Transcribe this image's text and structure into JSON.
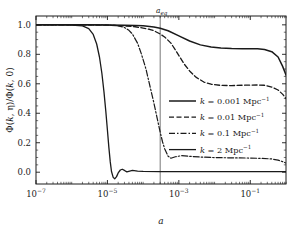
{
  "figure": {
    "background": "#ffffff",
    "line_color": "#1a1a1a",
    "axis_color": "#1a1a1a",
    "vline_color": "#555555"
  },
  "axes": {
    "xlabel": "a",
    "ylabel_parts": {
      "num": "Φ(k, η)",
      "den": "Φ(k, 0)",
      "full": "Φ(k, η)/Φ(k, 0)"
    },
    "x_scale": "log",
    "y_scale": "linear",
    "xlim": [
      1e-07,
      1.0
    ],
    "ylim": [
      -0.08,
      1.06
    ],
    "x_major_ticks": [
      {
        "value": 1e-07,
        "mantissa": "10",
        "exponent": "−7"
      },
      {
        "value": 1e-05,
        "mantissa": "10",
        "exponent": "−5"
      },
      {
        "value": 0.001,
        "mantissa": "10",
        "exponent": "−3"
      },
      {
        "value": 0.1,
        "mantissa": "10",
        "exponent": "−1"
      }
    ],
    "y_ticks": [
      {
        "value": 0.0,
        "label": "0.0"
      },
      {
        "value": 0.2,
        "label": "0.2"
      },
      {
        "value": 0.4,
        "label": "0.4"
      },
      {
        "value": 0.6,
        "label": "0.6"
      },
      {
        "value": 0.8,
        "label": "0.8"
      },
      {
        "value": 1.0,
        "label": "1.0"
      }
    ],
    "grid": false
  },
  "annotations": [
    {
      "name": "a-eq-vline",
      "base": "a",
      "subscript": "eq",
      "x_value": 0.0003,
      "style": "vertical-line"
    }
  ],
  "legend": {
    "position": "center-right",
    "entries": [
      {
        "label": "k = 0.001 Mpc⁻¹",
        "k_symbol": "k",
        "equals": "=",
        "value": "0.001",
        "unit": "Mpc",
        "unit_exp": "−1",
        "style": "solid",
        "width": 1.5
      },
      {
        "label": "k = 0.01 Mpc⁻¹",
        "k_symbol": "k",
        "equals": "=",
        "value": "0.01",
        "unit": "Mpc",
        "unit_exp": "−1",
        "style": "dashed",
        "width": 1.3
      },
      {
        "label": "k = 0.1 Mpc⁻¹",
        "k_symbol": "k",
        "equals": "=",
        "value": "0.1",
        "unit": "Mpc",
        "unit_exp": "−1",
        "style": "dashdot",
        "width": 1.2
      },
      {
        "label": "k = 2 Mpc⁻¹",
        "k_symbol": "k",
        "equals": "=",
        "value": "2",
        "unit": "Mpc",
        "unit_exp": "−1",
        "style": "solid",
        "width": 1.3
      }
    ]
  },
  "chart_data": {
    "type": "line",
    "title": "",
    "xlabel": "a",
    "ylabel": "Φ(k, η)/Φ(k, 0)",
    "xscale": "log",
    "xlim": [
      1e-07,
      1.0
    ],
    "ylim": [
      -0.08,
      1.06
    ],
    "grid": false,
    "legend_position": "center-right",
    "vertical_marker": {
      "label": "a_eq",
      "x": 0.0003
    },
    "series": [
      {
        "name": "k = 0.001 Mpc^-1",
        "style": "solid",
        "x": [
          1e-07,
          3e-07,
          1e-06,
          3e-06,
          1e-05,
          3e-05,
          6e-05,
          0.0001,
          0.0002,
          0.0003,
          0.0005,
          0.001,
          0.002,
          0.004,
          0.008,
          0.015,
          0.03,
          0.06,
          0.1,
          0.16,
          0.25,
          0.4,
          0.6,
          0.8,
          1.0
        ],
        "y": [
          1.0,
          1.0,
          1.0,
          1.0,
          0.999,
          0.998,
          0.996,
          0.993,
          0.985,
          0.977,
          0.96,
          0.925,
          0.89,
          0.864,
          0.85,
          0.843,
          0.839,
          0.838,
          0.838,
          0.837,
          0.833,
          0.818,
          0.782,
          0.72,
          0.66
        ]
      },
      {
        "name": "k = 0.01 Mpc^-1",
        "style": "dashed",
        "x": [
          1e-07,
          3e-07,
          1e-06,
          3e-06,
          1e-05,
          3e-05,
          6e-05,
          0.0001,
          0.00015,
          0.0002,
          0.0003,
          0.0004,
          0.0006,
          0.0009,
          0.0014,
          0.002,
          0.003,
          0.005,
          0.008,
          0.015,
          0.03,
          0.06,
          0.1,
          0.16,
          0.25,
          0.4,
          0.6,
          0.8,
          1.0
        ],
        "y": [
          1.0,
          1.0,
          1.0,
          0.999,
          0.998,
          0.993,
          0.987,
          0.978,
          0.97,
          0.96,
          0.938,
          0.918,
          0.876,
          0.81,
          0.735,
          0.687,
          0.645,
          0.612,
          0.597,
          0.589,
          0.588,
          0.59,
          0.591,
          0.592,
          0.59,
          0.578,
          0.558,
          0.53,
          0.5
        ]
      },
      {
        "name": "k = 0.1 Mpc^-1",
        "style": "dashdot",
        "x": [
          1e-07,
          1e-06,
          5e-06,
          1e-05,
          1.5e-05,
          2e-05,
          3e-05,
          4e-05,
          5e-05,
          7e-05,
          9e-05,
          0.00012,
          0.00016,
          0.0002,
          0.00025,
          0.0003,
          0.00035,
          0.0004,
          0.0005,
          0.0006,
          0.0008,
          0.0012,
          0.002,
          0.004,
          0.008,
          0.02,
          0.05,
          0.1,
          0.2,
          0.4,
          0.6,
          0.8,
          1.0
        ],
        "y": [
          1.0,
          1.0,
          1.0,
          0.999,
          0.997,
          0.993,
          0.982,
          0.963,
          0.938,
          0.875,
          0.8,
          0.7,
          0.57,
          0.47,
          0.36,
          0.272,
          0.205,
          0.16,
          0.108,
          0.095,
          0.105,
          0.112,
          0.108,
          0.103,
          0.1,
          0.098,
          0.097,
          0.096,
          0.094,
          0.09,
          0.082,
          0.072,
          0.062
        ]
      },
      {
        "name": "k = 2 Mpc^-1",
        "style": "solid",
        "x": [
          1e-07,
          5e-07,
          1e-06,
          2e-06,
          3e-06,
          4e-06,
          5e-06,
          6e-06,
          7e-06,
          8e-06,
          9e-06,
          1e-05,
          1.1e-05,
          1.2e-05,
          1.3e-05,
          1.45e-05,
          1.6e-05,
          1.8e-05,
          2e-05,
          2.3e-05,
          2.6e-05,
          3e-05,
          3.5e-05,
          4.2e-05,
          5e-05,
          7e-05,
          0.0001,
          0.0003,
          0.001,
          0.01,
          0.1,
          1.0
        ],
        "y": [
          1.0,
          1.0,
          0.999,
          0.993,
          0.975,
          0.935,
          0.87,
          0.78,
          0.67,
          0.545,
          0.415,
          0.285,
          0.165,
          0.07,
          0.005,
          -0.035,
          -0.045,
          -0.03,
          -0.005,
          0.015,
          0.02,
          0.012,
          0.002,
          0.008,
          0.012,
          0.008,
          0.005,
          0.004,
          0.004,
          0.004,
          0.004,
          0.004
        ]
      }
    ]
  }
}
